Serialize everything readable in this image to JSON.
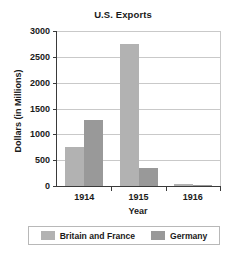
{
  "chart_data": {
    "type": "bar",
    "title": "U.S. Exports",
    "xlabel": "Year",
    "ylabel": "Dollars (in Millions)",
    "categories": [
      "1914",
      "1915",
      "1916"
    ],
    "series": [
      {
        "name": "Britain and France",
        "color": "#b2b2b2",
        "values": [
          750,
          2750,
          30
        ]
      },
      {
        "name": "Germany",
        "color": "#999999",
        "values": [
          1280,
          350,
          25
        ]
      }
    ],
    "ylim": [
      0,
      3000
    ],
    "yticks": [
      0,
      500,
      1000,
      1500,
      2000,
      2500,
      3000
    ],
    "ytick_labels": [
      "0",
      "500",
      "1000",
      "1500",
      "2000",
      "2500",
      "3000"
    ],
    "grid": true,
    "legend_position": "bottom"
  },
  "legend": {
    "entries": [
      {
        "label": "Britain and France",
        "color": "#b2b2b2"
      },
      {
        "label": "Germany",
        "color": "#999999"
      }
    ]
  },
  "axis_colors": {
    "axis_line": "#3a3a3a",
    "gridline": "#c9c9c9",
    "text": "#1a1a1a"
  }
}
